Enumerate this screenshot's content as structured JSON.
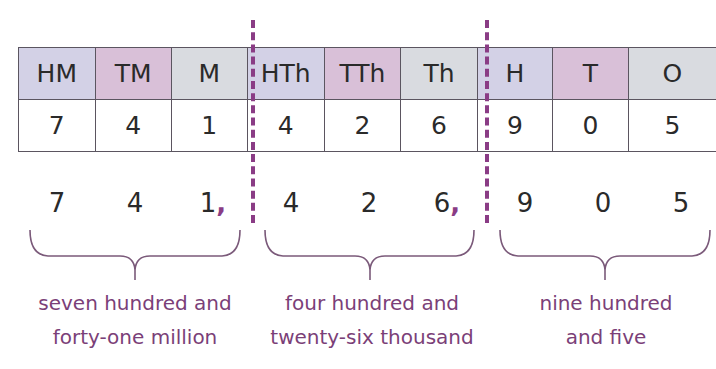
{
  "table": {
    "headers": [
      "HM",
      "TM",
      "M",
      "HTh",
      "TTh",
      "Th",
      "H",
      "T",
      "O"
    ],
    "header_colors": [
      "#d3d1e6",
      "#d9c0d8",
      "#d9dbe0",
      "#d3d1e6",
      "#d9c0d8",
      "#d9dbe0",
      "#d3d1e6",
      "#d9c0d8",
      "#d9dbe0"
    ],
    "values": [
      "7",
      "4",
      "1",
      "4",
      "2",
      "6",
      "9",
      "0",
      "5"
    ]
  },
  "number_row": {
    "digits": [
      "7",
      "4",
      "1",
      "4",
      "2",
      "6",
      "9",
      "0",
      "5"
    ],
    "separator": ","
  },
  "groups": [
    {
      "line1": "seven hundred and",
      "line2": "forty-one million"
    },
    {
      "line1": "four hundred and",
      "line2": "twenty-six thousand"
    },
    {
      "line1": "nine hundred",
      "line2": "and five"
    }
  ],
  "colors": {
    "divider": "#8a3c85",
    "label_text": "#7b3f78",
    "brace": "#7b5a7a"
  }
}
